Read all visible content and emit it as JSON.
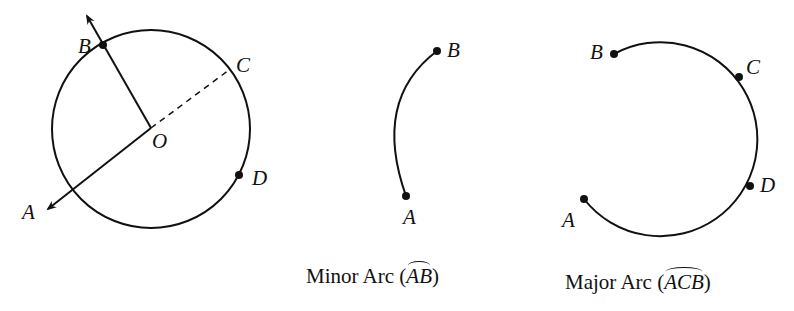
{
  "figure1": {
    "labels": {
      "A": "A",
      "B": "B",
      "C": "C",
      "D": "D",
      "O": "O"
    }
  },
  "figure2": {
    "labels": {
      "A": "A",
      "B": "B"
    },
    "caption_prefix": "Minor Arc (",
    "caption_arc": "AB",
    "caption_suffix": ")"
  },
  "figure3": {
    "labels": {
      "A": "A",
      "B": "B",
      "C": "C",
      "D": "D"
    },
    "caption_prefix": "Major Arc (",
    "caption_arc": "ACB",
    "caption_suffix": ")"
  },
  "colors": {
    "stroke": "#111111",
    "background": "#ffffff"
  }
}
